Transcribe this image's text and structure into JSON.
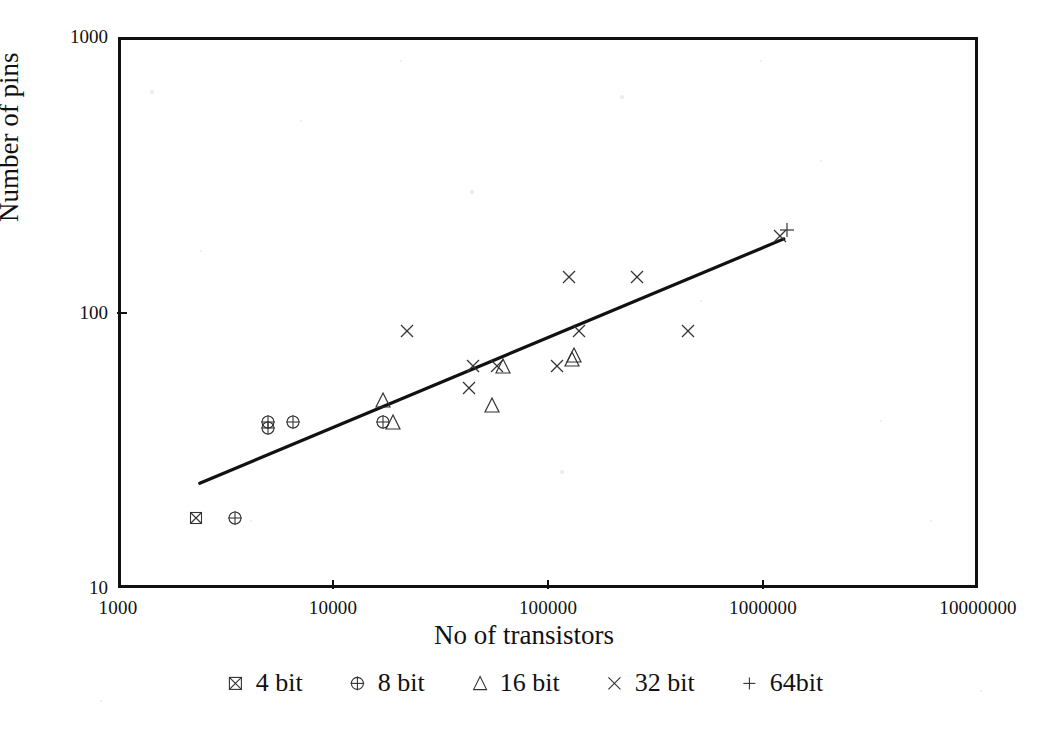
{
  "chart_data": {
    "type": "scatter",
    "title": "",
    "xlabel": "No of transistors",
    "ylabel": "Number of pins",
    "xscale": "log",
    "yscale": "log",
    "xlim": [
      1000,
      10000000
    ],
    "ylim": [
      10,
      1000
    ],
    "xticks": [
      1000,
      10000,
      100000,
      1000000,
      10000000
    ],
    "xtick_labels": [
      "1000",
      "10000",
      "100000",
      "1000000",
      "10000000"
    ],
    "yticks": [
      10,
      100,
      1000
    ],
    "ytick_labels": [
      "10",
      "100",
      "1000"
    ],
    "grid": false,
    "legend_position": "below-axis",
    "series": [
      {
        "name": "4 bit",
        "marker": "square-x",
        "points": [
          {
            "x": 2300,
            "y": 18
          }
        ]
      },
      {
        "name": "8 bit",
        "marker": "circle-plus",
        "points": [
          {
            "x": 3500,
            "y": 18
          },
          {
            "x": 5000,
            "y": 40
          },
          {
            "x": 5000,
            "y": 38
          },
          {
            "x": 6500,
            "y": 40
          },
          {
            "x": 17000,
            "y": 40
          }
        ]
      },
      {
        "name": "16 bit",
        "marker": "triangle",
        "points": [
          {
            "x": 17000,
            "y": 48
          },
          {
            "x": 19000,
            "y": 40
          },
          {
            "x": 55000,
            "y": 46
          },
          {
            "x": 62000,
            "y": 64
          },
          {
            "x": 130000,
            "y": 68
          },
          {
            "x": 132000,
            "y": 70
          }
        ]
      },
      {
        "name": "32 bit",
        "marker": "cross-x",
        "points": [
          {
            "x": 22000,
            "y": 86
          },
          {
            "x": 45000,
            "y": 64
          },
          {
            "x": 43000,
            "y": 53
          },
          {
            "x": 58000,
            "y": 64
          },
          {
            "x": 110000,
            "y": 64
          },
          {
            "x": 125000,
            "y": 135
          },
          {
            "x": 140000,
            "y": 86
          },
          {
            "x": 260000,
            "y": 135
          },
          {
            "x": 450000,
            "y": 86
          },
          {
            "x": 1200000,
            "y": 190
          }
        ]
      },
      {
        "name": "64bit",
        "marker": "plus",
        "points": [
          {
            "x": 1300000,
            "y": 200
          }
        ]
      }
    ],
    "trendline": {
      "label": "regression fit",
      "x0": 2400,
      "y0": 24,
      "x1": 1250000,
      "y1": 185
    }
  },
  "legend": {
    "entries": [
      {
        "label": "4 bit",
        "marker": "square-x"
      },
      {
        "label": "8 bit",
        "marker": "circle-plus"
      },
      {
        "label": "16 bit",
        "marker": "triangle"
      },
      {
        "label": "32 bit",
        "marker": "cross-x"
      },
      {
        "label": "64bit",
        "marker": "plus"
      }
    ]
  },
  "style": {
    "ink": "#111111",
    "paper": "#ffffff",
    "marker_stroke": "#333333"
  }
}
